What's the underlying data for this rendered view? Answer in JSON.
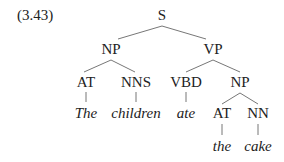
{
  "example_number": "(3.43)",
  "tree": {
    "nodes": [
      {
        "id": "S",
        "label": "S",
        "x": 162,
        "y": 8,
        "kind": "category"
      },
      {
        "id": "NP1",
        "label": "NP",
        "x": 111,
        "y": 42,
        "kind": "category"
      },
      {
        "id": "VP",
        "label": "VP",
        "x": 213,
        "y": 42,
        "kind": "category"
      },
      {
        "id": "AT1",
        "label": "AT",
        "x": 86,
        "y": 75,
        "kind": "category"
      },
      {
        "id": "NNS",
        "label": "NNS",
        "x": 136,
        "y": 75,
        "kind": "category"
      },
      {
        "id": "VBD",
        "label": "VBD",
        "x": 186,
        "y": 75,
        "kind": "category"
      },
      {
        "id": "NP2",
        "label": "NP",
        "x": 240,
        "y": 75,
        "kind": "category"
      },
      {
        "id": "w_the1",
        "label": "The",
        "x": 86,
        "y": 106,
        "kind": "word"
      },
      {
        "id": "w_children",
        "label": "children",
        "x": 136,
        "y": 106,
        "kind": "word"
      },
      {
        "id": "w_ate",
        "label": "ate",
        "x": 186,
        "y": 106,
        "kind": "word"
      },
      {
        "id": "AT2",
        "label": "AT",
        "x": 222,
        "y": 106,
        "kind": "category"
      },
      {
        "id": "NN",
        "label": "NN",
        "x": 258,
        "y": 106,
        "kind": "category"
      },
      {
        "id": "w_the2",
        "label": "the",
        "x": 222,
        "y": 139,
        "kind": "word"
      },
      {
        "id": "w_cake",
        "label": "cake",
        "x": 258,
        "y": 139,
        "kind": "word"
      }
    ],
    "edges": [
      [
        "S",
        "NP1"
      ],
      [
        "S",
        "VP"
      ],
      [
        "NP1",
        "AT1"
      ],
      [
        "NP1",
        "NNS"
      ],
      [
        "VP",
        "VBD"
      ],
      [
        "VP",
        "NP2"
      ],
      [
        "AT1",
        "w_the1"
      ],
      [
        "NNS",
        "w_children"
      ],
      [
        "VBD",
        "w_ate"
      ],
      [
        "NP2",
        "AT2"
      ],
      [
        "NP2",
        "NN"
      ],
      [
        "AT2",
        "w_the2"
      ],
      [
        "NN",
        "w_cake"
      ]
    ]
  }
}
